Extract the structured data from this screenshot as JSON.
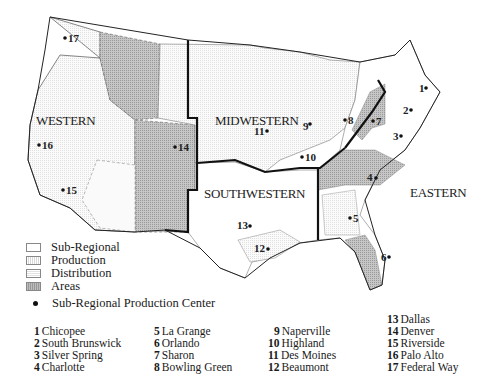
{
  "regions": [
    {
      "id": "western",
      "label": "WESTERN"
    },
    {
      "id": "midwestern",
      "label": "MIDWESTERN"
    },
    {
      "id": "southwestern",
      "label": "SOUTHWESTERN"
    },
    {
      "id": "eastern",
      "label": "EASTERN"
    }
  ],
  "legend": {
    "items": [
      {
        "label": "Sub-Regional",
        "swatch": "white"
      },
      {
        "label": "Production",
        "swatch": "vertical-hatch"
      },
      {
        "label": "Distribution",
        "swatch": "light-hatch"
      },
      {
        "label": "Areas",
        "swatch": "dark-hatch"
      }
    ],
    "dot_label": "Sub-Regional Production Center"
  },
  "cities": [
    {
      "num": "1",
      "name": "Chicopee"
    },
    {
      "num": "2",
      "name": "South Brunswick"
    },
    {
      "num": "3",
      "name": "Silver Spring"
    },
    {
      "num": "4",
      "name": "Charlotte"
    },
    {
      "num": "5",
      "name": "La Grange"
    },
    {
      "num": "6",
      "name": "Orlando"
    },
    {
      "num": "7",
      "name": "Sharon"
    },
    {
      "num": "8",
      "name": "Bowling Green"
    },
    {
      "num": "9",
      "name": "Naperville"
    },
    {
      "num": "10",
      "name": "Highland"
    },
    {
      "num": "11",
      "name": "Des Moines"
    },
    {
      "num": "12",
      "name": "Beaumont"
    },
    {
      "num": "13",
      "name": "Dallas"
    },
    {
      "num": "14",
      "name": "Denver"
    },
    {
      "num": "15",
      "name": "Riverside"
    },
    {
      "num": "16",
      "name": "Palo Alto"
    },
    {
      "num": "17",
      "name": "Federal Way"
    }
  ],
  "colors": {
    "area_dark": "#bdbdbd",
    "area_light": "#ececec",
    "border": "#111111"
  }
}
